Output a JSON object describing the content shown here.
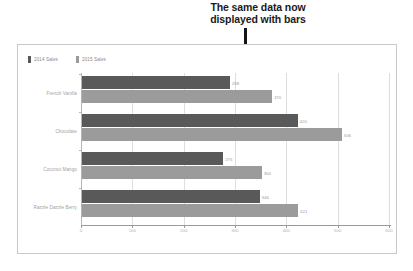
{
  "annotation": {
    "line1": "The same data now",
    "line2": "displayed with bars"
  },
  "chart_data": {
    "type": "bar",
    "orientation": "horizontal",
    "title": "",
    "xlabel": "",
    "ylabel": "",
    "xlim": [
      0,
      600
    ],
    "xticks": [
      "0",
      "100",
      "200",
      "300",
      "400",
      "500",
      "600"
    ],
    "grid": true,
    "legend_position": "top-left",
    "categories": [
      "French Vanilla",
      "Chocolate",
      "Coconut Mango",
      "Razzle Dazzle Berry"
    ],
    "series": [
      {
        "name": "2014 Sales",
        "color": "#595959",
        "values": [
          288,
          420,
          275,
          346
        ]
      },
      {
        "name": "2015 Sales",
        "color": "#9b9b9b",
        "values": [
          370,
          506,
          350,
          421
        ]
      }
    ]
  },
  "colors": {
    "frame_border": "#c9c9c9",
    "gridline": "#dedede",
    "axis": "#9a9a9a",
    "label_text": "#a0a0a0",
    "annotation_text": "#1b1b1b",
    "leader_line": "#141414"
  }
}
